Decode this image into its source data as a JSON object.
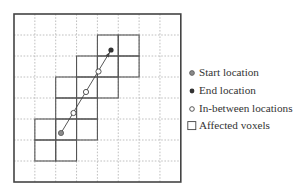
{
  "diagram": {
    "grid": {
      "origin_x": 14,
      "origin_y": 14,
      "cols": 8,
      "rows": 8,
      "cell_w": 20.85,
      "cell_h": 21.0,
      "frame_color": "#444444",
      "dash_color": "#b0b0b0"
    },
    "affected_voxels": [
      {
        "col": 4,
        "row": 1
      },
      {
        "col": 5,
        "row": 1
      },
      {
        "col": 3,
        "row": 2
      },
      {
        "col": 4,
        "row": 2
      },
      {
        "col": 5,
        "row": 2
      },
      {
        "col": 2,
        "row": 3
      },
      {
        "col": 3,
        "row": 3
      },
      {
        "col": 4,
        "row": 3
      },
      {
        "col": 2,
        "row": 4
      },
      {
        "col": 3,
        "row": 4
      },
      {
        "col": 1,
        "row": 5
      },
      {
        "col": 2,
        "row": 5
      },
      {
        "col": 3,
        "row": 5
      },
      {
        "col": 1,
        "row": 6
      },
      {
        "col": 2,
        "row": 6
      }
    ],
    "start": {
      "x": 61,
      "y": 133
    },
    "end": {
      "x": 111,
      "y": 50
    },
    "in_between": [
      {
        "x": 73.5,
        "y": 113
      },
      {
        "x": 86,
        "y": 92
      },
      {
        "x": 98.5,
        "y": 71.5
      }
    ],
    "colors": {
      "start_fill": "#8a8a8a",
      "end_fill": "#333333",
      "line": "#444444",
      "voxel_stroke": "#555555"
    }
  },
  "legend": {
    "items": [
      {
        "marker": "start-dot-icon",
        "label": "Start location"
      },
      {
        "marker": "end-dot-icon",
        "label": "End location"
      },
      {
        "marker": "hollow-dot-icon",
        "label": "In-between locations"
      },
      {
        "marker": "square-icon",
        "label": "Affected voxels"
      }
    ]
  }
}
